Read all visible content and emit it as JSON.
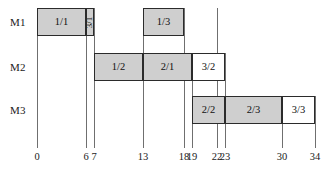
{
  "chart_data": {
    "type": "bar",
    "chart_kind": "gantt-schedule",
    "title": "",
    "xlabel": "",
    "ylabel": "",
    "xlim": [
      0,
      34
    ],
    "grid": false,
    "legend": "none",
    "axis_ticks": [
      0,
      6,
      7,
      13,
      18,
      19,
      22,
      23,
      30,
      34
    ],
    "axis_tick_labels": [
      "0",
      "6",
      "7",
      "13",
      "18",
      "19",
      "22",
      "23",
      "30",
      "34"
    ],
    "categories": [
      "M1",
      "M2",
      "M3"
    ],
    "series": [
      {
        "name": "M1",
        "tasks": [
          {
            "label": "1/1",
            "start": 0,
            "end": 6,
            "shaded": true,
            "rotated": false
          },
          {
            "label": "3/1",
            "start": 6,
            "end": 7,
            "shaded": true,
            "rotated": true
          },
          {
            "label": "1/3",
            "start": 13,
            "end": 18,
            "shaded": true,
            "rotated": false
          }
        ]
      },
      {
        "name": "M2",
        "tasks": [
          {
            "label": "1/2",
            "start": 7,
            "end": 13,
            "shaded": true,
            "rotated": false
          },
          {
            "label": "2/1",
            "start": 13,
            "end": 19,
            "shaded": true,
            "rotated": false
          },
          {
            "label": "3/2",
            "start": 19,
            "end": 23,
            "shaded": false,
            "rotated": false
          }
        ]
      },
      {
        "name": "M3",
        "tasks": [
          {
            "label": "2/2",
            "start": 19,
            "end": 23,
            "shaded": true,
            "rotated": false
          },
          {
            "label": "2/3",
            "start": 23,
            "end": 30,
            "shaded": true,
            "rotated": false
          },
          {
            "label": "3/3",
            "start": 30,
            "end": 34,
            "shaded": false,
            "rotated": false
          }
        ]
      }
    ]
  },
  "colors": {
    "shaded_fill": "#cfcfcf",
    "plain_fill": "#ffffff",
    "border": "#2b2b2b",
    "axis_line": "#6f6f6f",
    "text": "#1a1a1a"
  }
}
